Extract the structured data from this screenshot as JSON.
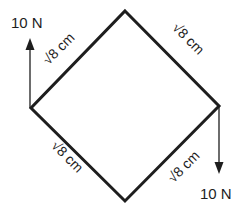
{
  "diagram": {
    "shape": "square rotated 45 degrees (rhombus)",
    "colors": {
      "stroke": "#1e1e1e",
      "background": "#ffffff"
    },
    "vertices": {
      "top": [
        125,
        11
      ],
      "right": [
        219,
        106
      ],
      "bottom": [
        125,
        201
      ],
      "left": [
        31,
        108
      ]
    },
    "sides": [
      {
        "id": "top-left",
        "label": "√8 cm"
      },
      {
        "id": "top-right",
        "label": "√8 cm"
      },
      {
        "id": "bottom-left",
        "label": "√8 cm"
      },
      {
        "id": "bottom-right",
        "label": "√8 cm"
      }
    ],
    "forces": [
      {
        "id": "left-up",
        "label": "10 N",
        "direction": "up",
        "at_vertex": "left"
      },
      {
        "id": "right-down",
        "label": "10 N",
        "direction": "down",
        "at_vertex": "right"
      }
    ]
  }
}
